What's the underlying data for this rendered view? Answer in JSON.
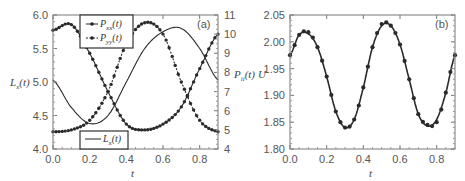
{
  "figure": {
    "panel_a": {
      "label": "(a)",
      "x_title": "t",
      "y_left_title": "L",
      "y_left_title_sub": "x",
      "y_left_title_arg": "(t)",
      "y_right_title": "P",
      "y_right_title_sub": "ii",
      "y_right_title_arg": "(t)",
      "x_ticks": [
        "0.0",
        "0.2",
        "0.4",
        "0.6",
        "0.8"
      ],
      "y_left_ticks": [
        "4.0",
        "4.5",
        "5.0",
        "5.5",
        "6.0"
      ],
      "y_right_ticks": [
        "4",
        "5",
        "6",
        "7",
        "8",
        "9",
        "10",
        "11"
      ],
      "legend_top": [
        {
          "name": "P",
          "sub": "xx",
          "arg": "(t)",
          "style": "solid-dots"
        },
        {
          "name": "P",
          "sub": "yy",
          "arg": "(t)",
          "style": "dashed-dots"
        }
      ],
      "legend_bottom": [
        {
          "name": "L",
          "sub": "x",
          "arg": "(t)",
          "style": "solid-line"
        }
      ]
    },
    "panel_b": {
      "label": "(b)",
      "x_title": "t",
      "y_title": "U",
      "x_ticks": [
        "0.0",
        "0.2",
        "0.4",
        "0.6",
        "0.8"
      ],
      "y_ticks": [
        "1.80",
        "1.85",
        "1.90",
        "1.95",
        "2.00",
        "2.05"
      ]
    },
    "colors": {
      "line": "#2a2a2a",
      "axis": "#777777",
      "text": "#555555"
    }
  },
  "chart_data": [
    {
      "type": "line",
      "title": "(a)",
      "xlabel": "t",
      "ylabel": "L_x(t)",
      "ylabel_right": "P_ii(t)",
      "xlim": [
        0,
        0.9
      ],
      "ylim": [
        4.0,
        6.0
      ],
      "ylim_right": [
        4,
        11
      ],
      "grid": false,
      "legend_position": "top-center and bottom-center",
      "x": [
        0,
        0.1,
        0.2,
        0.3,
        0.4,
        0.5,
        0.6,
        0.7,
        0.8,
        0.9
      ],
      "series": [
        {
          "name": "L_x(t)",
          "axis": "left",
          "style": "solid line",
          "values": [
            5.03,
            4.62,
            4.38,
            4.5,
            5.0,
            5.5,
            5.75,
            5.8,
            5.5,
            5.03
          ]
        },
        {
          "name": "P_xx(t)",
          "axis": "right",
          "style": "solid line with dots",
          "values": [
            10.2,
            10.5,
            9.0,
            7.0,
            5.3,
            5.0,
            5.3,
            6.2,
            8.2,
            10.0
          ]
        },
        {
          "name": "P_yy(t)",
          "axis": "right",
          "style": "dashed line with dots",
          "values": [
            4.9,
            5.0,
            5.5,
            7.0,
            9.5,
            10.6,
            10.0,
            7.5,
            5.5,
            4.9
          ]
        }
      ]
    },
    {
      "type": "line",
      "title": "(b)",
      "xlabel": "t",
      "ylabel": "U",
      "xlim": [
        0,
        0.9
      ],
      "ylim": [
        1.8,
        2.05
      ],
      "grid": false,
      "x": [
        0,
        0.05,
        0.1,
        0.15,
        0.2,
        0.25,
        0.3,
        0.35,
        0.4,
        0.45,
        0.5,
        0.55,
        0.6,
        0.65,
        0.7,
        0.75,
        0.8,
        0.85,
        0.9
      ],
      "series": [
        {
          "name": "U (line)",
          "style": "solid line",
          "values": [
            1.975,
            2.013,
            2.015,
            1.99,
            1.935,
            1.87,
            1.84,
            1.855,
            1.915,
            1.99,
            2.03,
            2.03,
            1.995,
            1.93,
            1.865,
            1.843,
            1.855,
            1.905,
            1.975
          ]
        },
        {
          "name": "U (dots)",
          "style": "dots",
          "values": [
            1.975,
            2.013,
            2.018,
            1.99,
            1.935,
            1.87,
            1.84,
            1.855,
            1.915,
            1.99,
            2.033,
            2.03,
            1.995,
            1.93,
            1.865,
            1.845,
            1.85,
            1.905,
            1.975
          ]
        }
      ]
    }
  ]
}
